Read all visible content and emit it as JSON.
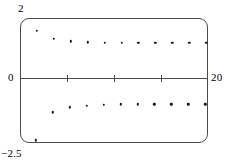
{
  "figure": {
    "background_color": "#ffffff",
    "frame_color": "#4a4a4a",
    "point_color": "#1a1a1a"
  },
  "labels": {
    "y_max": "2",
    "y_min": "−2.5",
    "y_zero": "0",
    "x_max": "20"
  },
  "chart_data": {
    "type": "scatter",
    "title": "",
    "subtitle": "",
    "xlabel": "",
    "ylabel": "",
    "xlim": [
      0,
      20
    ],
    "ylim": [
      -2.5,
      2
    ],
    "xticks": [
      5,
      10,
      15
    ],
    "xticklabels": [
      "",
      "",
      ""
    ],
    "yticks": [
      -2.5,
      0,
      2
    ],
    "yticklabels": [
      "−2.5",
      "0",
      "2"
    ],
    "grid": false,
    "legend": null,
    "legend_position": "none",
    "annotations": [],
    "series": [
      {
        "name": "upper branch",
        "marker": "dot",
        "x": [
          1.8,
          3.6,
          5.4,
          7.2,
          9.0,
          10.8,
          12.6,
          14.4,
          16.2,
          18.0,
          19.8
        ],
        "y": [
          1.55,
          1.25,
          1.16,
          1.12,
          1.11,
          1.1,
          1.1,
          1.1,
          1.1,
          1.1,
          1.1
        ]
      },
      {
        "name": "lower branch",
        "marker": "dot",
        "x": [
          1.7,
          3.5,
          5.3,
          7.1,
          8.9,
          10.7,
          12.5,
          14.3,
          16.1,
          17.9,
          19.7
        ],
        "y": [
          -2.4,
          -1.4,
          -1.22,
          -1.15,
          -1.12,
          -1.11,
          -1.1,
          -1.1,
          -1.1,
          -1.1,
          -1.1
        ]
      }
    ]
  }
}
